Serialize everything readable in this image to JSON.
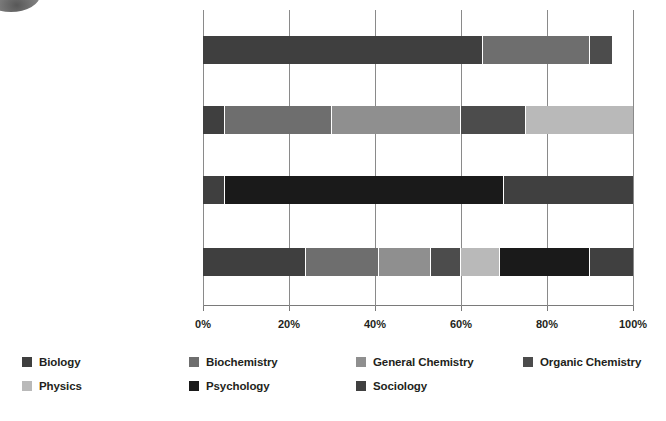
{
  "chart_data": {
    "type": "bar",
    "orientation": "horizontal",
    "stacked": true,
    "normalized": true,
    "title": "",
    "xlabel": "",
    "ylabel": "",
    "xlim": [
      0,
      100
    ],
    "grid": true,
    "legend_position": "bottom",
    "xtick_labels": [
      "0%",
      "20%",
      "40%",
      "60%",
      "80%",
      "100%"
    ],
    "xticks": [
      0,
      20,
      40,
      60,
      80,
      100
    ],
    "categories": [
      {
        "main": "Biological and Biochemical",
        "sub": "Foundations of Living Systems"
      },
      {
        "main": "Chemical and Physical",
        "sub": "Foundations of Biological Systems"
      },
      {
        "main": "Psychological, Social, and Biological",
        "sub": "Foundations of Behavior"
      },
      {
        "main": "MCAT",
        "sub": ""
      }
    ],
    "series": [
      {
        "name": "Biology",
        "color": "#3f3f3f",
        "values": [
          65,
          5,
          5,
          24
        ]
      },
      {
        "name": "Biochemistry",
        "color": "#6e6e6e",
        "values": [
          25,
          25,
          0,
          17
        ]
      },
      {
        "name": "General Chemistry",
        "color": "#8f8f8f",
        "values": [
          0,
          30,
          0,
          12
        ]
      },
      {
        "name": "Organic Chemistry",
        "color": "#4c4c4c",
        "values": [
          5,
          15,
          0,
          7
        ]
      },
      {
        "name": "Physics",
        "color": "#b9b9b9",
        "values": [
          0,
          25,
          0,
          9
        ]
      },
      {
        "name": "Psychology",
        "color": "#1a1a1a",
        "values": [
          0,
          0,
          65,
          21
        ]
      },
      {
        "name": "Sociology",
        "color": "#404040",
        "values": [
          0,
          0,
          30,
          10
        ]
      }
    ],
    "axis_color": "#7a7a7a",
    "grid_color": "#8a8a8a",
    "text_color": "#231f20"
  },
  "legend": {
    "items": [
      {
        "label": "Biology",
        "color": "#3f3f3f"
      },
      {
        "label": "Biochemistry",
        "color": "#6e6e6e"
      },
      {
        "label": "General Chemistry",
        "color": "#8f8f8f"
      },
      {
        "label": "Organic Chemistry",
        "color": "#4c4c4c"
      },
      {
        "label": "Physics",
        "color": "#b9b9b9"
      },
      {
        "label": "Psychology",
        "color": "#1a1a1a"
      },
      {
        "label": "Sociology",
        "color": "#404040"
      }
    ]
  }
}
